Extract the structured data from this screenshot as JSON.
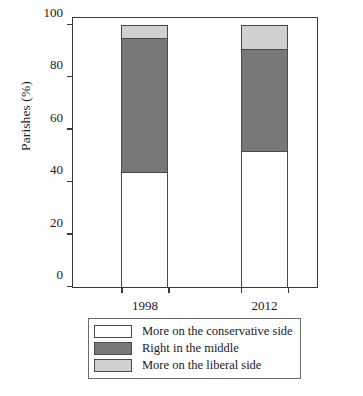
{
  "chart_data": {
    "type": "bar",
    "subtype": "stacked-100-percent",
    "title": "",
    "xlabel": "",
    "ylabel": "Parishes (%)",
    "categories": [
      "1998",
      "2012"
    ],
    "ylim": [
      0,
      100
    ],
    "yticks": [
      0,
      20,
      40,
      60,
      80,
      100
    ],
    "ytick_labels": [
      "0",
      "20",
      "40",
      "60",
      "80",
      "100"
    ],
    "grid": false,
    "legend_position": "below-plot",
    "series": [
      {
        "name": "More on the conservative side",
        "values": [
          44,
          52
        ],
        "color": "#ffffff"
      },
      {
        "name": "Right in the middle",
        "values": [
          51,
          39
        ],
        "color": "#787878"
      },
      {
        "name": "More on the liberal side",
        "values": [
          5,
          9
        ],
        "color": "#d0d0d0"
      }
    ],
    "cumulative_tops": {
      "1998": [
        44,
        95,
        100
      ],
      "2012": [
        52,
        91,
        100
      ]
    }
  },
  "axes": {
    "y_title": "Parishes (%)",
    "y_tick_0": "0",
    "y_tick_1": "20",
    "y_tick_2": "40",
    "y_tick_3": "60",
    "y_tick_4": "80",
    "y_tick_5": "100",
    "x_tick_0": "1998",
    "x_tick_1": "2012"
  },
  "legend": {
    "items": [
      {
        "label": "More on the conservative side",
        "color": "#ffffff"
      },
      {
        "label": "Right in the middle",
        "color": "#787878"
      },
      {
        "label": "More on the liberal side",
        "color": "#d0d0d0"
      }
    ]
  },
  "colors": {
    "conservative": "#ffffff",
    "middle": "#787878",
    "liberal": "#d0d0d0",
    "axis": "#3a3a3a",
    "outline": "#4a4a4a",
    "text": "#1a1a1a",
    "background": "#ffffff"
  }
}
